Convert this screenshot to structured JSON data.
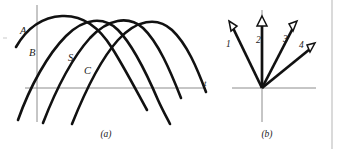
{
  "figure": {
    "background_color": "#ffffff",
    "ink_color": "#111111",
    "axis_color": "#8c8c8c",
    "border_color": "#b0b0b0",
    "width": 342,
    "height": 149
  },
  "panel_a": {
    "caption": "(a)",
    "axis_x_label": "t",
    "curve_labels": [
      {
        "text": "A",
        "x": 20,
        "y": 34
      },
      {
        "text": "B",
        "x": 29,
        "y": 56
      },
      {
        "text": "S",
        "x": 68,
        "y": 61
      },
      {
        "text": "C",
        "x": 84,
        "y": 74
      }
    ],
    "axes": {
      "horizontal": {
        "x1": 25,
        "y1": 88,
        "x2": 205,
        "y2": 88
      },
      "vertical": {
        "x1": 37,
        "y1": 5,
        "x2": 37,
        "y2": 122
      }
    },
    "curves": [
      {
        "name": "curve-A",
        "path": "M16,47 C28,26 44,17 62,16 C82,15 99,27 112,48 C124,67 136,90 147,110"
      },
      {
        "name": "curve-B",
        "path": "M18,120 C30,86 48,54 66,36 C84,18 104,16 118,30 C133,45 146,72 158,100 C163,111 167,118 170,124"
      },
      {
        "name": "curve-S",
        "path": "M43,123 C55,92 72,58 90,38 C108,19 128,15 143,28 C158,42 170,70 181,98"
      },
      {
        "name": "curve-C",
        "path": "M72,124 C84,94 100,60 118,40 C136,20 157,16 172,30 C187,44 197,68 206,92"
      }
    ]
  },
  "panel_b": {
    "caption": "(b)",
    "origin": {
      "x": 262,
      "y": 88
    },
    "axes": {
      "horizontal": {
        "x1": 232,
        "y1": 88,
        "x2": 316,
        "y2": 88
      },
      "vertical": {
        "x1": 262,
        "y1": 10,
        "x2": 262,
        "y2": 122
      }
    },
    "vectors": [
      {
        "label": "1",
        "tip_x": 230,
        "tip_y": 22,
        "label_x": 226,
        "label_y": 47
      },
      {
        "label": "2",
        "tip_x": 262,
        "tip_y": 17,
        "label_x": 255,
        "label_y": 42
      },
      {
        "label": "3",
        "tip_x": 296,
        "tip_y": 22,
        "label_x": 283,
        "label_y": 42
      },
      {
        "label": "4",
        "tip_x": 314,
        "tip_y": 45,
        "label_x": 300,
        "label_y": 50
      }
    ]
  }
}
